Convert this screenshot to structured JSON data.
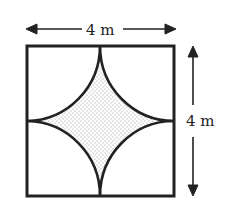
{
  "diagram": {
    "type": "geometry-figure",
    "width_label": "4 m",
    "height_label": "4 m",
    "shaded_region": "dotted concave diamond formed by four arcs",
    "colors": {
      "stroke": "#222222",
      "shade_dot": "#8a8a8a",
      "background": "#ffffff"
    }
  }
}
